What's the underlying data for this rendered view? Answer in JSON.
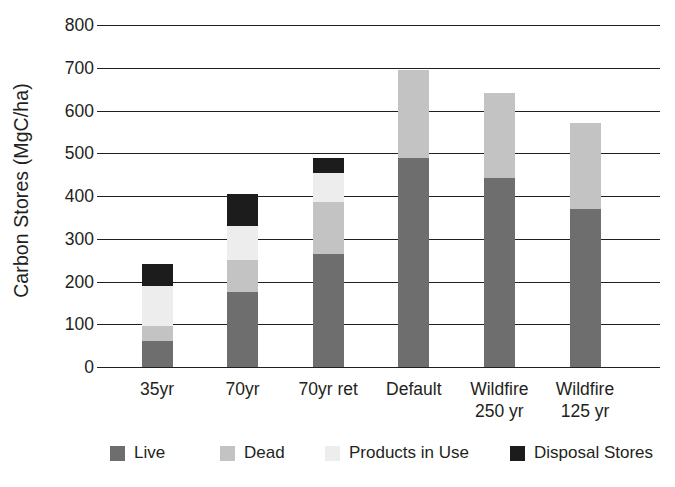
{
  "chart_data": {
    "type": "bar",
    "subtype": "stacked-bar",
    "title": "",
    "xlabel": "",
    "ylabel": "Carbon Stores (MgC/ha)",
    "ylim": [
      0,
      800
    ],
    "ytick_step": 100,
    "ytick_labels": [
      "800",
      "700",
      "600",
      "500",
      "400",
      "300",
      "200",
      "100",
      "0"
    ],
    "ytick_values": [
      800,
      700,
      600,
      500,
      400,
      300,
      200,
      100,
      0
    ],
    "grid": true,
    "grid_axis": "y",
    "legend_position": "bottom",
    "categories": [
      "35yr",
      "70yr",
      "70yr ret",
      "Default",
      "Wildfire 250 yr",
      "Wildfire 125 yr"
    ],
    "category_lines": [
      [
        "35yr"
      ],
      [
        "70yr"
      ],
      [
        "70yr ret"
      ],
      [
        "Default"
      ],
      [
        "Wildfire",
        "250 yr"
      ],
      [
        "Wildfire",
        "125 yr"
      ]
    ],
    "series": [
      {
        "name": "Live",
        "color": "#6e6e6e",
        "values": [
          60,
          175,
          265,
          490,
          443,
          370
        ]
      },
      {
        "name": "Dead",
        "color": "#c3c3c3",
        "values": [
          35,
          75,
          120,
          205,
          197,
          200
        ]
      },
      {
        "name": "Products in Use",
        "color": "#ededed",
        "values": [
          95,
          80,
          70,
          0,
          0,
          0
        ]
      },
      {
        "name": "Disposal Stores",
        "color": "#1c1c1c",
        "values": [
          50,
          75,
          35,
          0,
          0,
          0
        ]
      }
    ],
    "totals": [
      240,
      405,
      490,
      695,
      640,
      570
    ]
  },
  "legend": {
    "items": [
      {
        "label": "Live",
        "color": "#6e6e6e"
      },
      {
        "label": "Dead",
        "color": "#c3c3c3"
      },
      {
        "label": "Products in Use",
        "color": "#ededed"
      },
      {
        "label": "Disposal Stores",
        "color": "#1c1c1c"
      }
    ]
  },
  "colors": {
    "axis": "#231f20",
    "text": "#231f20",
    "background": "#ffffff"
  }
}
